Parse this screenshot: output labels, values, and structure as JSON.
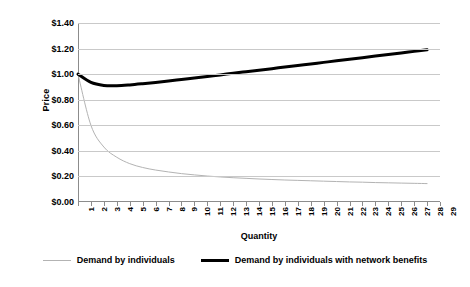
{
  "chart_data": {
    "type": "line",
    "title": "",
    "xlabel": "Quantity",
    "ylabel": "Price",
    "xlim": [
      1,
      29
    ],
    "ylim": [
      0,
      1.4
    ],
    "ytick_step": 0.2,
    "grid": true,
    "legend_position": "bottom",
    "y_tick_labels": [
      "$0.00",
      "$0.20",
      "$0.40",
      "$0.60",
      "$0.80",
      "$1.00",
      "$1.20",
      "$1.40"
    ],
    "y_tick_values": [
      0,
      0.2,
      0.4,
      0.6,
      0.8,
      1.0,
      1.2,
      1.4
    ],
    "x_tick_labels": [
      "1",
      "2",
      "3",
      "4",
      "5",
      "6",
      "7",
      "8",
      "9",
      "10",
      "11",
      "12",
      "13",
      "14",
      "15",
      "16",
      "17",
      "18",
      "19",
      "20",
      "21",
      "22",
      "23",
      "24",
      "25",
      "26",
      "27",
      "28",
      "29"
    ],
    "categories": [
      1,
      2,
      3,
      4,
      5,
      6,
      7,
      8,
      9,
      10,
      11,
      12,
      13,
      14,
      15,
      16,
      17,
      18,
      19,
      20,
      21,
      22,
      23,
      24,
      25,
      26,
      27,
      28
    ],
    "series": [
      {
        "name": "Demand by individuals",
        "color": "#b3b3b3",
        "width": 1,
        "values": [
          1.0,
          0.6,
          0.43,
          0.35,
          0.3,
          0.27,
          0.25,
          0.235,
          0.222,
          0.212,
          0.203,
          0.196,
          0.19,
          0.185,
          0.18,
          0.176,
          0.172,
          0.169,
          0.166,
          0.163,
          0.16,
          0.157,
          0.155,
          0.152,
          0.15,
          0.148,
          0.146,
          0.144
        ]
      },
      {
        "name": "Demand by individuals with network benefits",
        "color": "#000000",
        "width": 3,
        "values": [
          1.0,
          0.935,
          0.912,
          0.91,
          0.916,
          0.925,
          0.935,
          0.946,
          0.958,
          0.97,
          0.982,
          0.994,
          1.007,
          1.019,
          1.031,
          1.043,
          1.056,
          1.068,
          1.08,
          1.092,
          1.104,
          1.117,
          1.129,
          1.141,
          1.153,
          1.166,
          1.178,
          1.19
        ]
      }
    ]
  },
  "legend": {
    "items": [
      {
        "label": "Demand by individuals",
        "style": "thin"
      },
      {
        "label": "Demand by individuals with network benefits",
        "style": "thick"
      }
    ]
  }
}
